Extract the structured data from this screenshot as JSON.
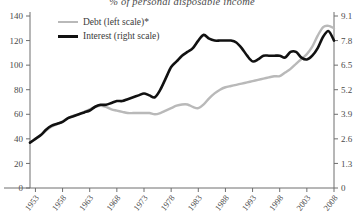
{
  "chart_data": {
    "type": "line",
    "title": "% of personal disposable income",
    "xlabel": "",
    "ylabel": "",
    "grid": false,
    "legend_position": "top-left",
    "x": [
      1952,
      1953,
      1954,
      1955,
      1956,
      1957,
      1958,
      1959,
      1960,
      1961,
      1962,
      1963,
      1964,
      1965,
      1966,
      1967,
      1968,
      1969,
      1970,
      1971,
      1972,
      1973,
      1974,
      1975,
      1976,
      1977,
      1978,
      1979,
      1980,
      1981,
      1982,
      1983,
      1984,
      1985,
      1986,
      1987,
      1988,
      1989,
      1990,
      1991,
      1992,
      1993,
      1994,
      1995,
      1996,
      1997,
      1998,
      1999,
      2000,
      2001,
      2002,
      2003,
      2004,
      2005,
      2006,
      2007,
      2008
    ],
    "xtick_labels": [
      "1953",
      "1958",
      "1963",
      "1968",
      "1973",
      "1978",
      "1983",
      "1988",
      "1993",
      "1998",
      "2003",
      "2008"
    ],
    "xticks": [
      1953,
      1958,
      1963,
      1968,
      1973,
      1978,
      1983,
      1988,
      1993,
      1998,
      2003,
      2008
    ],
    "xlim": [
      1952,
      2008
    ],
    "axes": [
      {
        "id": "left",
        "label": "Debt (left scale)*",
        "ticks": [
          0,
          20,
          40,
          60,
          80,
          100,
          120,
          140
        ],
        "tick_labels": [
          "0",
          "20",
          "40",
          "60",
          "80",
          "100",
          "120",
          "140"
        ],
        "lim": [
          0,
          140
        ]
      },
      {
        "id": "right",
        "label": "Interest (right scale)",
        "ticks": [
          0,
          1.3,
          2.6,
          3.9,
          5.2,
          6.5,
          7.8,
          9.1
        ],
        "tick_labels": [
          "0",
          "1.3",
          "2.6",
          "3.9",
          "5.2",
          "6.5",
          "7.8",
          "9.1"
        ],
        "lim": [
          0,
          9.1
        ]
      }
    ],
    "series": [
      {
        "name": "Debt (left scale)*",
        "axis": "left",
        "color": "#b9b9b9",
        "values": [
          37,
          40,
          43,
          47,
          50,
          52,
          54,
          57,
          59,
          60,
          62,
          64,
          66,
          67,
          66,
          64,
          63,
          62,
          61,
          61,
          61,
          61,
          61,
          60,
          61,
          63,
          65,
          67,
          68,
          68,
          66,
          65,
          68,
          73,
          77,
          80,
          82,
          83,
          84,
          85,
          86,
          87,
          88,
          89,
          90,
          91,
          91,
          94,
          97,
          101,
          105,
          109,
          115,
          124,
          131,
          132,
          130
        ]
      },
      {
        "name": "Interest (right scale)",
        "axis": "right",
        "color": "#111111",
        "values": [
          2.4,
          2.6,
          2.8,
          3.1,
          3.3,
          3.4,
          3.5,
          3.7,
          3.8,
          3.9,
          4.0,
          4.1,
          4.3,
          4.4,
          4.4,
          4.5,
          4.6,
          4.6,
          4.7,
          4.8,
          4.9,
          5.0,
          4.9,
          4.8,
          5.2,
          5.8,
          6.4,
          6.7,
          7.0,
          7.2,
          7.4,
          7.8,
          8.1,
          7.9,
          7.8,
          7.8,
          7.8,
          7.8,
          7.7,
          7.4,
          7.0,
          6.7,
          6.8,
          7.0,
          7.0,
          7.0,
          7.0,
          6.9,
          7.2,
          7.2,
          6.9,
          6.8,
          7.0,
          7.4,
          8.0,
          8.3,
          7.8
        ]
      }
    ],
    "annotations": []
  },
  "legend": {
    "items": [
      {
        "label": "Debt (left scale)*",
        "color": "#b9b9b9"
      },
      {
        "label": "Interest (right scale)",
        "color": "#111111"
      }
    ]
  }
}
